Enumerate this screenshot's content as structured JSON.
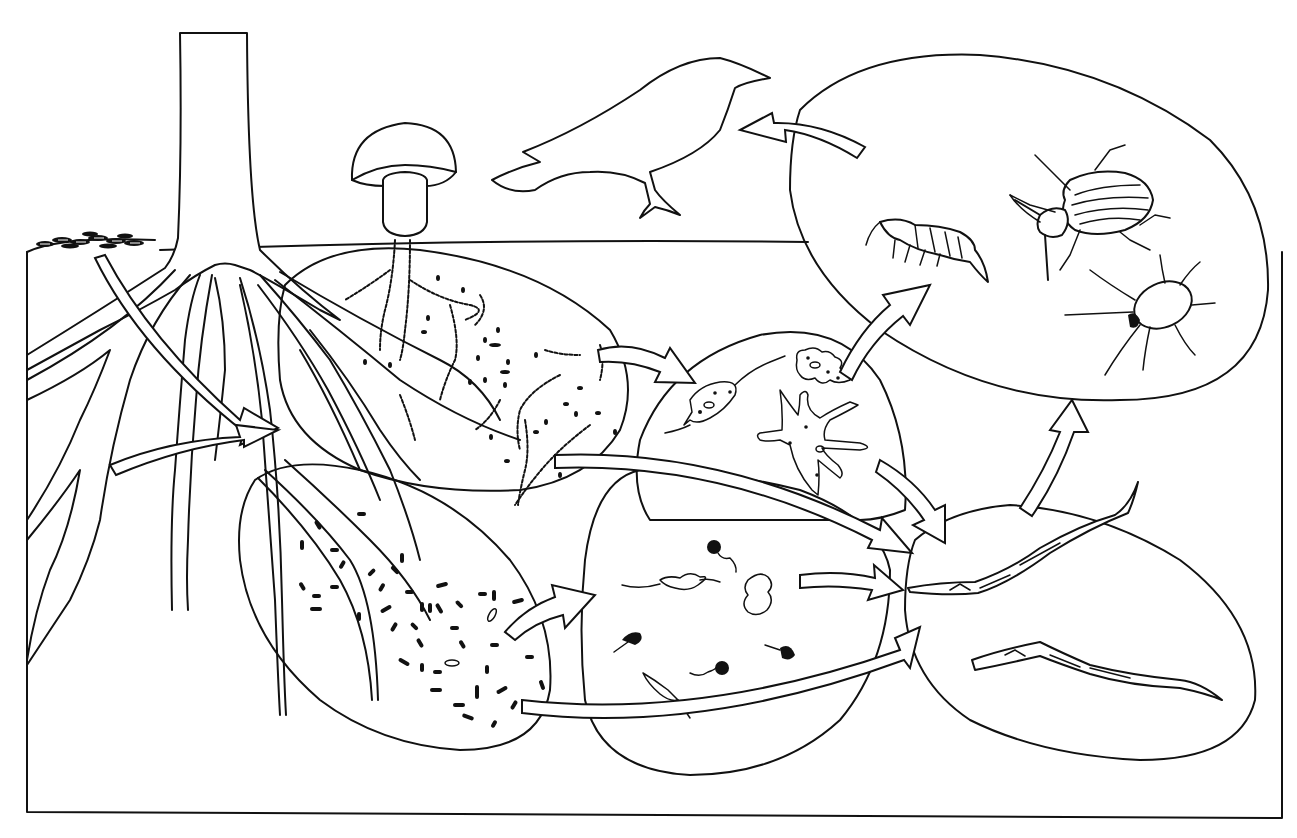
{
  "figure": {
    "top_caption_fragment": "",
    "background": "#ffffff",
    "line_color": "#111111"
  },
  "components": {
    "plant": {
      "label": "Plant (tree trunk and roots)",
      "icon": "tree-roots-icon"
    },
    "leaf_litter": {
      "label": "Organic matter (leaf litter)",
      "icon": "leaf-litter-icon"
    },
    "fungi": {
      "label": "Fungi",
      "icon": "mushroom-icon"
    },
    "bacteria": {
      "label": "Bacteria",
      "icon": "bacteria-icon"
    },
    "protozoa": {
      "label": "Protozoa",
      "icon": "protozoa-icon"
    },
    "fungal_feeders": {
      "label": "Amoebae / fungal-feeding protozoa",
      "icon": "amoeba-icon"
    },
    "nematodes": {
      "label": "Nematodes",
      "icon": "nematode-icon"
    },
    "arthropods": {
      "label": "Arthropods (springtail, beetle, mite)",
      "icon": "arthropod-icon"
    },
    "birds": {
      "label": "Birds",
      "icon": "bird-icon"
    }
  },
  "arrows": [
    {
      "from": "leaf_litter",
      "to": "plant"
    },
    {
      "from": "plant",
      "to": "bacteria_fungi"
    },
    {
      "from": "fungi",
      "to": "fungal_feeders"
    },
    {
      "from": "fungi",
      "to": "nematodes"
    },
    {
      "from": "bacteria",
      "to": "protozoa"
    },
    {
      "from": "bacteria",
      "to": "nematodes"
    },
    {
      "from": "protozoa",
      "to": "nematodes"
    },
    {
      "from": "fungal_feeders",
      "to": "nematodes"
    },
    {
      "from": "fungal_feeders",
      "to": "arthropods"
    },
    {
      "from": "nematodes",
      "to": "arthropods"
    },
    {
      "from": "arthropods",
      "to": "birds"
    }
  ]
}
